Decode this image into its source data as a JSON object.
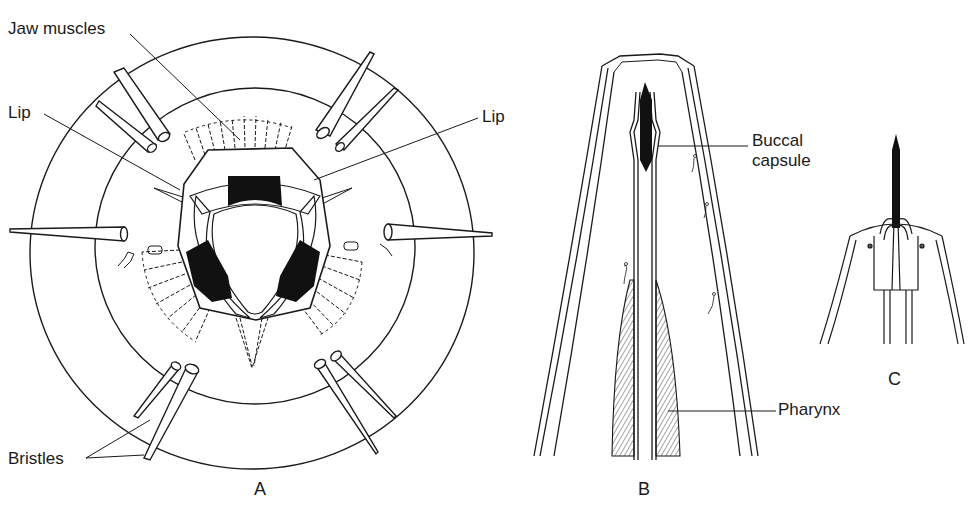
{
  "figure": {
    "panels": [
      {
        "id": "A",
        "label": "A"
      },
      {
        "id": "B",
        "label": "B"
      },
      {
        "id": "C",
        "label": "C"
      }
    ],
    "labels": {
      "jaw_muscles": "Jaw muscles",
      "lip_left": "Lip",
      "lip_right": "Lip",
      "bristles": "Bristles",
      "buccal_line1": "Buccal",
      "buccal_line2": "capsule",
      "pharynx": "Pharynx"
    },
    "colors": {
      "ink": "#1a1a1a",
      "background": "#ffffff"
    }
  }
}
